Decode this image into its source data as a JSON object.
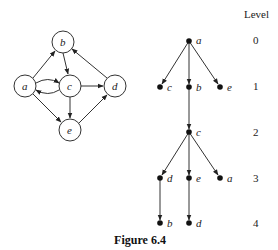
{
  "caption": "Figure 6.4",
  "graph": {
    "nodes": [
      {
        "id": "a",
        "label": "a"
      },
      {
        "id": "b",
        "label": "b"
      },
      {
        "id": "c",
        "label": "c"
      },
      {
        "id": "d",
        "label": "d"
      },
      {
        "id": "e",
        "label": "e"
      }
    ],
    "edges": [
      {
        "from": "a",
        "to": "b"
      },
      {
        "from": "a",
        "to": "c"
      },
      {
        "from": "c",
        "to": "a"
      },
      {
        "from": "a",
        "to": "e"
      },
      {
        "from": "b",
        "to": "c"
      },
      {
        "from": "c",
        "to": "d"
      },
      {
        "from": "c",
        "to": "e"
      },
      {
        "from": "d",
        "to": "b"
      },
      {
        "from": "e",
        "to": "d"
      }
    ]
  },
  "tree": {
    "level_header": "Level",
    "levels": [
      "0",
      "1",
      "2",
      "3",
      "4"
    ],
    "nodes": [
      {
        "label": "a",
        "level": 0
      },
      {
        "label": "c",
        "level": 1
      },
      {
        "label": "b",
        "level": 1
      },
      {
        "label": "e",
        "level": 1
      },
      {
        "label": "c",
        "level": 2
      },
      {
        "label": "d",
        "level": 3
      },
      {
        "label": "e",
        "level": 3
      },
      {
        "label": "a",
        "level": 3
      },
      {
        "label": "b",
        "level": 4
      },
      {
        "label": "d",
        "level": 4
      }
    ]
  }
}
